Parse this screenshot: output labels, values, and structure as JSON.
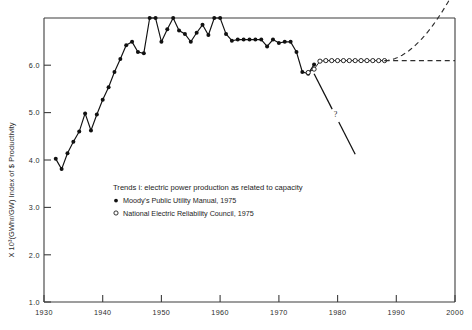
{
  "chart_data": {
    "type": "line",
    "title": "",
    "xlabel": "",
    "ylabel": "X 10³(GWhr/GW) Index of $ Productivity",
    "xlim": [
      1930,
      2000
    ],
    "ylim": [
      1.0,
      6.0
    ],
    "xticks": [
      1930,
      1940,
      1950,
      1960,
      1970,
      1980,
      1990,
      2000
    ],
    "xticklabels": [
      "1930",
      "1940",
      "1950",
      "1960",
      "1970",
      "1980",
      "1990",
      "2000"
    ],
    "yticks": [
      1.0,
      2.0,
      3.0,
      4.0,
      5.0,
      6.0
    ],
    "yticklabels": [
      "1.0",
      "2.0",
      "3.0",
      "4.0",
      "5.0",
      "6.0"
    ],
    "grid": false,
    "legend_position": "inside-center-left",
    "series": [
      {
        "name": "Moody's Public Utility Manual, 1975",
        "marker": "filled-circle",
        "linestyle": "solid",
        "x": [
          1932,
          1933,
          1934,
          1935,
          1936,
          1937,
          1938,
          1939,
          1940,
          1941,
          1942,
          1943,
          1944,
          1945,
          1946,
          1947,
          1948,
          1949,
          1950,
          1951,
          1952,
          1953,
          1954,
          1955,
          1956,
          1957,
          1958,
          1959,
          1960,
          1961,
          1962,
          1963,
          1964,
          1965,
          1966,
          1967,
          1968,
          1969,
          1970,
          1971,
          1972,
          1973,
          1974,
          1975,
          1976
        ],
        "y": [
          3.52,
          3.34,
          3.62,
          3.82,
          4.0,
          4.32,
          4.02,
          4.3,
          4.56,
          4.78,
          5.05,
          5.28,
          5.52,
          5.58,
          5.4,
          5.38,
          6.0,
          6.0,
          5.58,
          5.8,
          6.0,
          5.78,
          5.72,
          5.58,
          5.74,
          5.88,
          5.7,
          6.0,
          6.0,
          5.72,
          5.6,
          5.62,
          5.62,
          5.62,
          5.62,
          5.62,
          5.5,
          5.62,
          5.56,
          5.58,
          5.58,
          5.4,
          5.05,
          5.02,
          5.18
        ]
      },
      {
        "name": "National Electric Reliability Council, 1975",
        "marker": "open-circle",
        "linestyle": "solid",
        "x": [
          1975,
          1976,
          1977,
          1978,
          1979,
          1980,
          1981,
          1982,
          1983,
          1984,
          1985,
          1986,
          1987,
          1988
        ],
        "y": [
          5.04,
          5.1,
          5.24,
          5.25,
          5.25,
          5.25,
          5.25,
          5.25,
          5.25,
          5.25,
          5.25,
          5.25,
          5.25,
          5.25
        ]
      }
    ],
    "annotations": [
      {
        "name": "decline-projection",
        "label": "?",
        "description": "solid declining projection line with question mark",
        "x": [
          1976,
          1983
        ],
        "y": [
          5.02,
          3.6
        ]
      },
      {
        "name": "flat-projection",
        "label": "",
        "description": "horizontal dashed projection holding constant",
        "x": [
          1988,
          2000
        ],
        "y": [
          5.25,
          5.25
        ]
      },
      {
        "name": "growth-projection",
        "label": "",
        "description": "rising dashed projection curve",
        "x": [
          1988,
          2000
        ],
        "y": [
          5.25,
          6.5
        ]
      }
    ],
    "legend": {
      "title": "Trends i: electric power production as related to capacity",
      "entries": [
        {
          "marker": "filled-circle",
          "label": "Moody's Public Utility Manual, 1975"
        },
        {
          "marker": "open-circle",
          "label": "National Electric Reliability Council, 1975"
        }
      ]
    }
  },
  "axes": {
    "y_axis_title": "X 10³(GWhr/GW) Index of $ Productivity",
    "y_tick_labels": [
      "6.0",
      "5.0",
      "4.0",
      "3.0",
      "2.0",
      "1.0"
    ],
    "x_tick_labels": [
      "1930",
      "1940",
      "1950",
      "1960",
      "1970",
      "1980",
      "1990",
      "2000"
    ]
  },
  "marks": {
    "question_mark": "?"
  },
  "colors": {
    "ink": "#111111",
    "axis": "#3d3d3d",
    "background": "#ffffff"
  }
}
